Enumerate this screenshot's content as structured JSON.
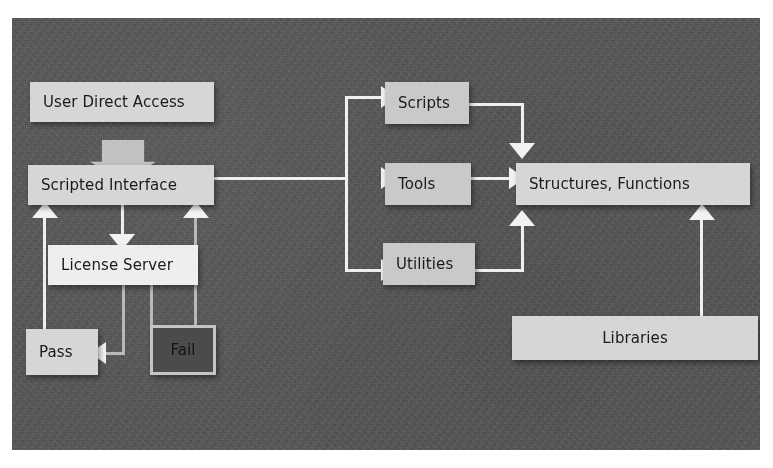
{
  "diagram": {
    "background_color": "#5a5a5a",
    "node_color": "#c9c9c9",
    "connector_color": "#efefef",
    "fail_color": "#4b4b4b",
    "nodes": [
      {
        "id": "user_direct_access",
        "label": "User Direct Access"
      },
      {
        "id": "scripted_interface",
        "label": "Scripted Interface"
      },
      {
        "id": "license_server",
        "label": "License Server"
      },
      {
        "id": "pass",
        "label": "Pass"
      },
      {
        "id": "fail",
        "label": "Fail"
      },
      {
        "id": "scripts",
        "label": "Scripts"
      },
      {
        "id": "tools",
        "label": "Tools"
      },
      {
        "id": "utilities",
        "label": "Utilities"
      },
      {
        "id": "structures_functions",
        "label": "Structures, Functions"
      },
      {
        "id": "libraries",
        "label": "Libraries"
      }
    ],
    "edges": [
      {
        "from": "user_direct_access",
        "to": "scripted_interface"
      },
      {
        "from": "scripted_interface",
        "to": "license_server"
      },
      {
        "from": "license_server",
        "to": "pass"
      },
      {
        "from": "license_server",
        "to": "fail"
      },
      {
        "from": "pass",
        "to": "scripted_interface"
      },
      {
        "from": "fail",
        "to": "scripted_interface"
      },
      {
        "from": "scripted_interface",
        "to": "scripts"
      },
      {
        "from": "scripted_interface",
        "to": "tools"
      },
      {
        "from": "scripted_interface",
        "to": "utilities"
      },
      {
        "from": "scripts",
        "to": "structures_functions"
      },
      {
        "from": "tools",
        "to": "structures_functions"
      },
      {
        "from": "utilities",
        "to": "structures_functions"
      },
      {
        "from": "libraries",
        "to": "structures_functions"
      }
    ]
  }
}
